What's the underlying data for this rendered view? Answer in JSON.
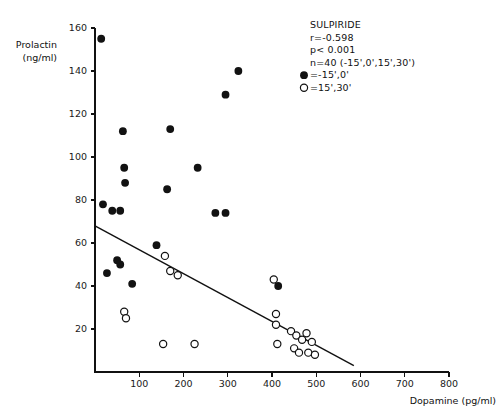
{
  "chart_data": {
    "type": "scatter",
    "title": "",
    "xlabel": "Dopamine  (pg/ml)",
    "ylabel_line1": "Prolactin",
    "ylabel_line2": "(ng/ml)",
    "xlim": [
      0,
      800
    ],
    "ylim": [
      0,
      160
    ],
    "xticks": [
      100,
      200,
      300,
      400,
      500,
      600,
      700,
      800
    ],
    "xtick_labels": [
      "100",
      "200",
      "300",
      "400",
      "500",
      "600",
      "700",
      "800"
    ],
    "yticks": [
      20,
      40,
      60,
      80,
      100,
      120,
      140,
      160
    ],
    "ytick_labels": [
      "20",
      "40",
      "60",
      "80",
      "100",
      "120",
      "140",
      "160"
    ],
    "grid": false,
    "legend_position": "top-right",
    "annotations": {
      "drug": "SULPIRIDE",
      "correlation": "r=-0.598",
      "pvalue": "p< 0.001",
      "sample": "n=40  (-15',0',15',30')"
    },
    "legend": [
      {
        "marker": "filled-circle",
        "label": "=-15',0'"
      },
      {
        "marker": "open-circle",
        "label": "=15',30'"
      }
    ],
    "series": [
      {
        "name": "-15',0'",
        "marker": "filled-circle",
        "points": [
          [
            14,
            155
          ],
          [
            63,
            112
          ],
          [
            57,
            75
          ],
          [
            66,
            95
          ],
          [
            68,
            88
          ],
          [
            170,
            113
          ],
          [
            163,
            85
          ],
          [
            232,
            95
          ],
          [
            295,
            129
          ],
          [
            324,
            140
          ],
          [
            272,
            74
          ],
          [
            295,
            74
          ],
          [
            18,
            78
          ],
          [
            39,
            75
          ],
          [
            27,
            46
          ],
          [
            50,
            52
          ],
          [
            57,
            50
          ],
          [
            139,
            59
          ],
          [
            84,
            41
          ],
          [
            414,
            40
          ]
        ]
      },
      {
        "name": "15',30'",
        "marker": "open-circle",
        "points": [
          [
            158,
            54
          ],
          [
            170,
            47
          ],
          [
            187,
            45
          ],
          [
            66,
            28
          ],
          [
            70,
            25
          ],
          [
            154,
            13
          ],
          [
            225,
            13
          ],
          [
            404,
            43
          ],
          [
            409,
            27
          ],
          [
            409,
            22
          ],
          [
            412,
            13
          ],
          [
            443,
            19
          ],
          [
            450,
            11
          ],
          [
            455,
            17
          ],
          [
            461,
            9
          ],
          [
            468,
            15
          ],
          [
            478,
            18
          ],
          [
            482,
            9
          ],
          [
            490,
            14
          ],
          [
            497,
            8
          ]
        ]
      }
    ],
    "regression_line": {
      "x_start": 0,
      "y_start": 68,
      "x_end": 585,
      "y_end": 3
    }
  }
}
